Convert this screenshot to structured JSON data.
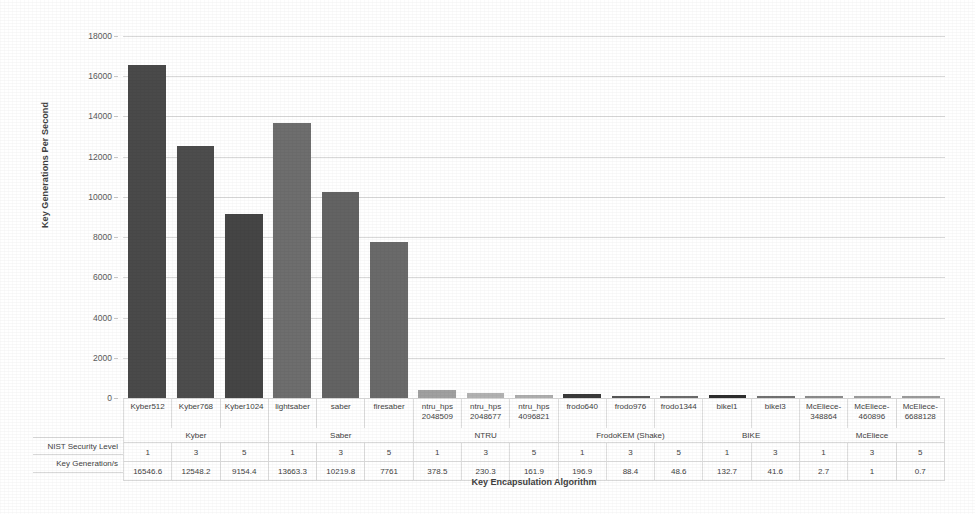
{
  "chart_data": {
    "type": "bar",
    "title": "",
    "xlabel": "Key Encapsulation Algorithm",
    "ylabel": "Key Generations Per Second",
    "ylim": [
      0,
      18000
    ],
    "yticks": [
      0,
      2000,
      4000,
      6000,
      8000,
      10000,
      12000,
      14000,
      16000,
      18000
    ],
    "ytick_labels": [
      "0",
      "2000",
      "4000",
      "6000",
      "8000",
      "10000",
      "12000",
      "14000",
      "16000",
      "18000"
    ],
    "grid": true,
    "legend": "none",
    "categories": [
      "Kyber512",
      "Kyber768",
      "Kyber1024",
      "lightsaber",
      "saber",
      "firesaber",
      "ntru_hps 2048509",
      "ntru_hps 2048677",
      "ntru_hps 4096821",
      "frodo640",
      "frodo976",
      "frodo1344",
      "bikel1",
      "bikel3",
      "McEliece-348864",
      "McEliece-460896",
      "McEliece-6688128"
    ],
    "values": [
      16546.6,
      12548.2,
      9154.4,
      13663.3,
      10219.8,
      7761,
      378.5,
      230.3,
      161.9,
      196.9,
      88.4,
      48.6,
      132.7,
      41.6,
      2.7,
      1,
      0.7
    ],
    "bar_colors": [
      "#4a4a4a",
      "#4d4d4d",
      "#454545",
      "#6e6e6e",
      "#636363",
      "#6a6a6a",
      "#a0a0a0",
      "#b2b2b2",
      "#aeaeae",
      "#3a3a3a",
      "#565656",
      "#6a6a6a",
      "#2e2e2e",
      "#707070",
      "#8a8a8a",
      "#9a9a9a",
      "#9a9a9a"
    ]
  },
  "axis": {
    "y_title": "Key Generations Per Second",
    "x_title": "Key Encapsulation Algorithm"
  },
  "table": {
    "row_headers": [
      "NIST Security Level",
      "Key Generation/s"
    ],
    "category_labels": [
      [
        "Kyber512",
        ""
      ],
      [
        "Kyber768",
        ""
      ],
      [
        "Kyber1024",
        ""
      ],
      [
        "lightsaber",
        ""
      ],
      [
        "saber",
        ""
      ],
      [
        "firesaber",
        ""
      ],
      [
        "ntru_hps",
        "2048509"
      ],
      [
        "ntru_hps",
        "2048677"
      ],
      [
        "ntru_hps",
        "4096821"
      ],
      [
        "frodo640",
        ""
      ],
      [
        "frodo976",
        ""
      ],
      [
        "frodo1344",
        ""
      ],
      [
        "bikel1",
        ""
      ],
      [
        "bikel3",
        ""
      ],
      [
        "McEliece-",
        "348864"
      ],
      [
        "McEliece-",
        "460896"
      ],
      [
        "McEliece-",
        "6688128"
      ]
    ],
    "groups": [
      {
        "label": "Kyber",
        "span": 3
      },
      {
        "label": "Saber",
        "span": 3
      },
      {
        "label": "NTRU",
        "span": 3
      },
      {
        "label": "FrodoKEM (Shake)",
        "span": 3
      },
      {
        "label": "BIKE",
        "span": 2
      },
      {
        "label": "McEliece",
        "span": 3
      }
    ],
    "nist_security_level": [
      "1",
      "3",
      "5",
      "1",
      "3",
      "5",
      "1",
      "3",
      "5",
      "1",
      "3",
      "5",
      "1",
      "3",
      "1",
      "3",
      "5"
    ],
    "key_generation_per_s": [
      "16546.6",
      "12548.2",
      "9154.4",
      "13663.3",
      "10219.8",
      "7761",
      "378.5",
      "230.3",
      "161.9",
      "196.9",
      "88.4",
      "48.6",
      "132.7",
      "41.6",
      "2.7",
      "1",
      "0.7"
    ]
  },
  "colors": {
    "background": "#ffffff",
    "gridline": "#d9d9d9",
    "text": "#3f3f3f",
    "tick_text": "#5a5a5a",
    "table_border": "#dedede"
  }
}
